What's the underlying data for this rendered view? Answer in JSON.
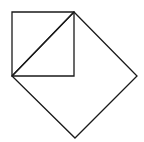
{
  "diagram": {
    "stroke_color": "#1a1a1a",
    "background": "#ffffff",
    "stroke_width": 1.3,
    "small_square": {
      "points": "12,12 74,12 74,76 12,76"
    },
    "diagonal": {
      "x1": 12,
      "y1": 76,
      "x2": 74,
      "y2": 12
    },
    "large_square": {
      "points": "74,12 137,76 75,138 12,76"
    }
  }
}
